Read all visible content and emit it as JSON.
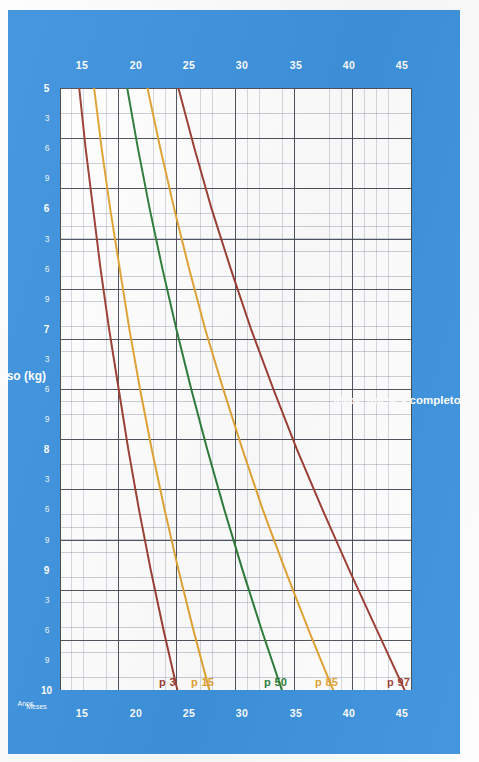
{
  "chart_data": {
    "type": "line",
    "title": "",
    "xlabel": "Idade (meses completos e anos)",
    "ylabel": "Peso (kg)",
    "orientation": "rotated-90",
    "grid": true,
    "legend_position": "inline-top",
    "xlim": [
      5,
      10
    ],
    "ylim": [
      13,
      46
    ],
    "x_unit_labels": {
      "months": "Meses",
      "years": "Anos"
    },
    "x_year_ticks": [
      5,
      6,
      7,
      8,
      9,
      10
    ],
    "x_month_ticks": [
      3,
      6,
      9
    ],
    "x_tick_sequence": [
      "5",
      "3",
      "6",
      "9",
      "6",
      "3",
      "6",
      "9",
      "7",
      "3",
      "6",
      "9",
      "8",
      "3",
      "6",
      "9",
      "9",
      "3",
      "6",
      "9",
      "10"
    ],
    "y_ticks": [
      15,
      20,
      25,
      30,
      35,
      40,
      45
    ],
    "series": [
      {
        "name": "p 97",
        "color": "#9c3f35",
        "points": [
          [
            5,
            24.1
          ],
          [
            5.5,
            25.6
          ],
          [
            6,
            27.2
          ],
          [
            6.5,
            29.0
          ],
          [
            7,
            30.9
          ],
          [
            7.5,
            33.0
          ],
          [
            8,
            35.2
          ],
          [
            8.5,
            37.6
          ],
          [
            9,
            40.1
          ],
          [
            9.5,
            42.7
          ],
          [
            10,
            45.3
          ]
        ]
      },
      {
        "name": "p 85",
        "color": "#e2a434",
        "points": [
          [
            5,
            21.2
          ],
          [
            5.5,
            22.4
          ],
          [
            6,
            23.7
          ],
          [
            6.5,
            25.1
          ],
          [
            7,
            26.6
          ],
          [
            7.5,
            28.3
          ],
          [
            8,
            30.1
          ],
          [
            8.5,
            32.0
          ],
          [
            9,
            34.1
          ],
          [
            9.5,
            36.3
          ],
          [
            10,
            38.6
          ]
        ]
      },
      {
        "name": "p 50",
        "color": "#2e7d3a",
        "points": [
          [
            5,
            19.3
          ],
          [
            5.5,
            20.3
          ],
          [
            6,
            21.4
          ],
          [
            6.5,
            22.6
          ],
          [
            7,
            23.9
          ],
          [
            7.5,
            25.3
          ],
          [
            8,
            26.8
          ],
          [
            8.5,
            28.4
          ],
          [
            9,
            30.1
          ],
          [
            9.5,
            31.9
          ],
          [
            10,
            33.8
          ]
        ]
      },
      {
        "name": "p 15",
        "color": "#e2a434",
        "points": [
          [
            5,
            16.2
          ],
          [
            5.5,
            16.9
          ],
          [
            6,
            17.7
          ],
          [
            6.5,
            18.6
          ],
          [
            7,
            19.5
          ],
          [
            7.5,
            20.5
          ],
          [
            8,
            21.6
          ],
          [
            8.5,
            22.8
          ],
          [
            9,
            24.1
          ],
          [
            9.5,
            25.5
          ],
          [
            10,
            27.0
          ]
        ]
      },
      {
        "name": "p 3",
        "color": "#9c3f35",
        "points": [
          [
            5,
            14.8
          ],
          [
            5.5,
            15.4
          ],
          [
            6,
            16.1
          ],
          [
            6.5,
            16.8
          ],
          [
            7,
            17.6
          ],
          [
            7.5,
            18.5
          ],
          [
            8,
            19.4
          ],
          [
            8.5,
            20.4
          ],
          [
            9,
            21.5
          ],
          [
            9.5,
            22.7
          ],
          [
            10,
            24.0
          ]
        ]
      }
    ]
  },
  "axes": {
    "weight_label": "Peso (kg)",
    "age_label": "Idade (meses completos e anos)",
    "months_label": "Meses",
    "years_label": "Anos",
    "weight_ticks": [
      "45",
      "40",
      "35",
      "30",
      "25",
      "20",
      "15"
    ],
    "age_ticks": [
      {
        "label": "10",
        "value": 10,
        "type": "year"
      },
      {
        "label": "9",
        "value": 9.75,
        "type": "month"
      },
      {
        "label": "6",
        "value": 9.5,
        "type": "month"
      },
      {
        "label": "3",
        "value": 9.25,
        "type": "month"
      },
      {
        "label": "9",
        "value": 9,
        "type": "year"
      },
      {
        "label": "9",
        "value": 8.75,
        "type": "month"
      },
      {
        "label": "6",
        "value": 8.5,
        "type": "month"
      },
      {
        "label": "3",
        "value": 8.25,
        "type": "month"
      },
      {
        "label": "8",
        "value": 8,
        "type": "year"
      },
      {
        "label": "9",
        "value": 7.75,
        "type": "month"
      },
      {
        "label": "6",
        "value": 7.5,
        "type": "month"
      },
      {
        "label": "3",
        "value": 7.25,
        "type": "month"
      },
      {
        "label": "7",
        "value": 7,
        "type": "year"
      },
      {
        "label": "9",
        "value": 6.75,
        "type": "month"
      },
      {
        "label": "6",
        "value": 6.5,
        "type": "month"
      },
      {
        "label": "3",
        "value": 6.25,
        "type": "month"
      },
      {
        "label": "6",
        "value": 6,
        "type": "year"
      },
      {
        "label": "9",
        "value": 5.75,
        "type": "month"
      },
      {
        "label": "6",
        "value": 5.5,
        "type": "month"
      },
      {
        "label": "3",
        "value": 5.25,
        "type": "month"
      },
      {
        "label": "5",
        "value": 5,
        "type": "year"
      }
    ]
  },
  "percentile_labels": [
    {
      "text": "p 97",
      "color": "#9c3f35"
    },
    {
      "text": "p 85",
      "color": "#e2a434"
    },
    {
      "text": "p 50",
      "color": "#2e7d3a"
    },
    {
      "text": "p 15",
      "color": "#e2a434"
    },
    {
      "text": "p 3",
      "color": "#9c3f35"
    }
  ],
  "colors": {
    "background": "#3d92dd",
    "page": "#fdfdfd",
    "plot": "#ffffff",
    "p97": "#9c3f35",
    "p85": "#e2a434",
    "p50": "#2e7d3a",
    "p15": "#e2a434",
    "p3": "#9c3f35",
    "grid_minor": "#8a93a5",
    "grid_major": "#4a4a52"
  }
}
